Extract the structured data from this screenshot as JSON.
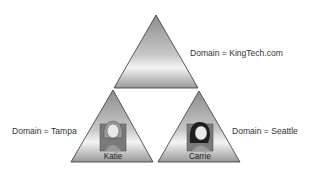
{
  "diagram": {
    "title": "",
    "nodes": [
      {
        "id": "root",
        "label": "Domain = KingTech.com",
        "shape": "triangle"
      },
      {
        "id": "tampa",
        "label": "Domain = Tampa",
        "shape": "triangle",
        "user": "Katie",
        "parent": "root"
      },
      {
        "id": "seattle",
        "label": "Domain = Seattle",
        "shape": "triangle",
        "user": "Carrie",
        "parent": "root"
      }
    ],
    "colors": {
      "triangle_dark": "#8a8a8a",
      "triangle_light": "#f2f2f2",
      "outline": "#333333"
    }
  }
}
